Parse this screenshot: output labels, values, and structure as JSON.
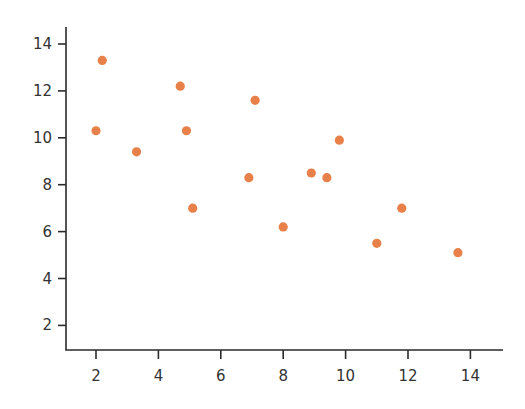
{
  "chart_data": {
    "type": "scatter",
    "title": "",
    "xlabel": "",
    "ylabel": "",
    "xlim": [
      1,
      15
    ],
    "ylim": [
      1,
      14.7
    ],
    "grid": false,
    "legend": null,
    "x_ticks": [
      2,
      4,
      6,
      8,
      10,
      12,
      14
    ],
    "y_ticks": [
      2,
      4,
      6,
      8,
      10,
      12,
      14
    ],
    "marker_color": "#E8804A",
    "axis_color": "#2b2b2b",
    "points": [
      {
        "x": 2.0,
        "y": 10.3
      },
      {
        "x": 2.2,
        "y": 13.3
      },
      {
        "x": 3.3,
        "y": 9.4
      },
      {
        "x": 4.7,
        "y": 12.2
      },
      {
        "x": 4.9,
        "y": 10.3
      },
      {
        "x": 5.1,
        "y": 7.0
      },
      {
        "x": 6.9,
        "y": 8.3
      },
      {
        "x": 7.1,
        "y": 11.6
      },
      {
        "x": 8.0,
        "y": 6.2
      },
      {
        "x": 8.9,
        "y": 8.5
      },
      {
        "x": 9.4,
        "y": 8.3
      },
      {
        "x": 9.8,
        "y": 9.9
      },
      {
        "x": 11.0,
        "y": 5.5
      },
      {
        "x": 11.8,
        "y": 7.0
      },
      {
        "x": 13.6,
        "y": 5.1
      }
    ]
  }
}
